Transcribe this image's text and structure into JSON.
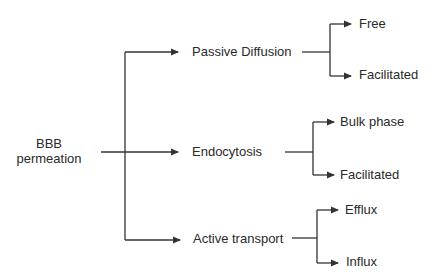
{
  "diagram": {
    "type": "tree",
    "stroke_color": "#333333",
    "text_color": "#2a2a2a",
    "root": {
      "line1": "BBB",
      "line2": "permeation"
    },
    "branches": [
      {
        "label": "Passive Diffusion",
        "children": [
          "Free",
          "Facilitated"
        ]
      },
      {
        "label": "Endocytosis",
        "children": [
          "Bulk phase",
          "Facilitated"
        ]
      },
      {
        "label": "Active transport",
        "children": [
          "Efflux",
          "Influx"
        ]
      }
    ]
  }
}
